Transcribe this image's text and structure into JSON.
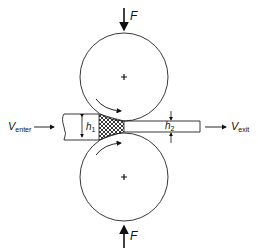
{
  "diagram": {
    "type": "rolling-process",
    "labels": {
      "force_top": "F",
      "force_bottom": "F",
      "v_enter_main": "V",
      "v_enter_sub": "enter",
      "v_exit_main": "V",
      "v_exit_sub": "exit",
      "h1_main": "h",
      "h1_sub": "1",
      "h2_main": "h",
      "h2_sub": "2"
    },
    "rolls": [
      {
        "name": "top-roll",
        "cx": 124,
        "cy": 77,
        "r": 44,
        "rotation": "clockwise"
      },
      {
        "name": "bottom-roll",
        "cx": 124,
        "cy": 177,
        "r": 44,
        "rotation": "counter-clockwise"
      }
    ],
    "colors": {
      "line": "#222222",
      "background": "#ffffff"
    }
  }
}
